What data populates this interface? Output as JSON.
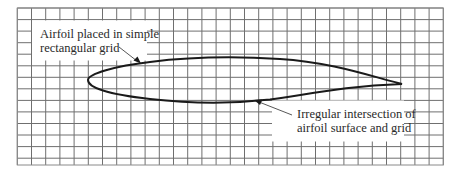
{
  "figure": {
    "type": "diagram",
    "grid": {
      "left": 17.3,
      "top": 8,
      "right": 443.3,
      "bottom": 165,
      "columns": 30,
      "rows": 13.6,
      "cell_width": 14.2,
      "cell_height": 11.55,
      "line_color": "#7a7a7a",
      "border_color": "#8a8a8a"
    },
    "airfoil": {
      "leading_edge": [
        88,
        80
      ],
      "trailing_edge": [
        402,
        84
      ],
      "stroke_color": "#1a1a1a"
    },
    "labels": {
      "upper": {
        "line1": "Airfoil placed in simple",
        "line2": "rectangular grid"
      },
      "lower": {
        "line1": "Irregular intersection of",
        "line2": "airfoil surface and grid"
      }
    }
  }
}
